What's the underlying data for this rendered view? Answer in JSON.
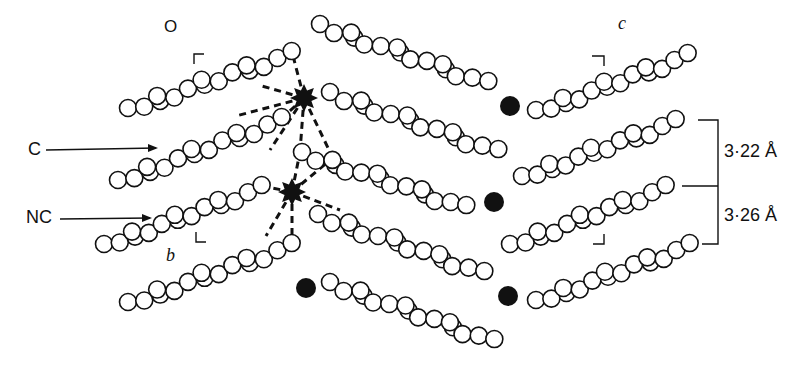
{
  "figure": {
    "labels": {
      "origin": "O",
      "c_label": "C",
      "nc_label": "NC",
      "axis_b": "b",
      "axis_c": "c",
      "spacing_1": "3·22 Å",
      "spacing_2": "3·26 Å"
    },
    "colors": {
      "ink": "#111111",
      "background": "#ffffff"
    },
    "chains_left_rising": [
      {
        "x0": 128,
        "y0": 108,
        "x1": 292,
        "y1": 52
      },
      {
        "x0": 118,
        "y0": 180,
        "x1": 282,
        "y1": 118
      },
      {
        "x0": 104,
        "y0": 244,
        "x1": 262,
        "y1": 186
      },
      {
        "x0": 128,
        "y0": 302,
        "x1": 292,
        "y1": 244
      }
    ],
    "chains_middle_falling": [
      {
        "x0": 320,
        "y0": 24,
        "x1": 488,
        "y1": 82
      },
      {
        "x0": 330,
        "y0": 92,
        "x1": 498,
        "y1": 150
      },
      {
        "x0": 302,
        "y0": 152,
        "x1": 466,
        "y1": 206
      },
      {
        "x0": 318,
        "y0": 214,
        "x1": 484,
        "y1": 272
      },
      {
        "x0": 330,
        "y0": 282,
        "x1": 494,
        "y1": 340
      }
    ],
    "chains_right_rising": [
      {
        "x0": 536,
        "y0": 110,
        "x1": 688,
        "y1": 54
      },
      {
        "x0": 522,
        "y0": 176,
        "x1": 676,
        "y1": 120
      },
      {
        "x0": 510,
        "y0": 244,
        "x1": 666,
        "y1": 186
      },
      {
        "x0": 536,
        "y0": 300,
        "x1": 690,
        "y1": 244
      }
    ],
    "metal_atoms": [
      {
        "x": 304,
        "y": 98,
        "r": 11,
        "coordinated": true
      },
      {
        "x": 292,
        "y": 192,
        "r": 11,
        "coordinated": true
      },
      {
        "x": 510,
        "y": 106,
        "r": 10,
        "coordinated": false
      },
      {
        "x": 494,
        "y": 202,
        "r": 10,
        "coordinated": false
      },
      {
        "x": 306,
        "y": 288,
        "r": 10,
        "coordinated": false
      },
      {
        "x": 508,
        "y": 296,
        "r": 10,
        "coordinated": false
      }
    ]
  }
}
